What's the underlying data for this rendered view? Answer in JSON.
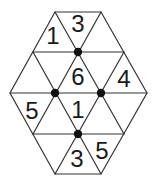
{
  "puzzle": {
    "type": "hexagonal-triangle-grid",
    "line_color": "#333333",
    "dot_color": "#111111",
    "vertices": {
      "rows": [
        {
          "y": 12,
          "x": [
            55,
            101
          ]
        },
        {
          "y": 52,
          "x": [
            33,
            78,
            124
          ]
        },
        {
          "y": 93,
          "x": [
            10,
            55,
            101,
            147
          ]
        },
        {
          "y": 134,
          "x": [
            33,
            78,
            124
          ]
        },
        {
          "y": 174,
          "x": [
            55,
            101
          ]
        }
      ]
    },
    "dots": [
      {
        "x": 78,
        "y": 52
      },
      {
        "x": 55,
        "y": 93
      },
      {
        "x": 101,
        "y": 93
      },
      {
        "x": 78,
        "y": 134
      }
    ],
    "clues": [
      {
        "value": "1",
        "x": 53,
        "y": 35
      },
      {
        "value": "3",
        "x": 78,
        "y": 23
      },
      {
        "value": "6",
        "x": 78,
        "y": 76
      },
      {
        "value": "4",
        "x": 124,
        "y": 78
      },
      {
        "value": "5",
        "x": 32,
        "y": 110
      },
      {
        "value": "1",
        "x": 78,
        "y": 109
      },
      {
        "value": "3",
        "x": 77,
        "y": 158
      },
      {
        "value": "5",
        "x": 102,
        "y": 150
      }
    ]
  }
}
